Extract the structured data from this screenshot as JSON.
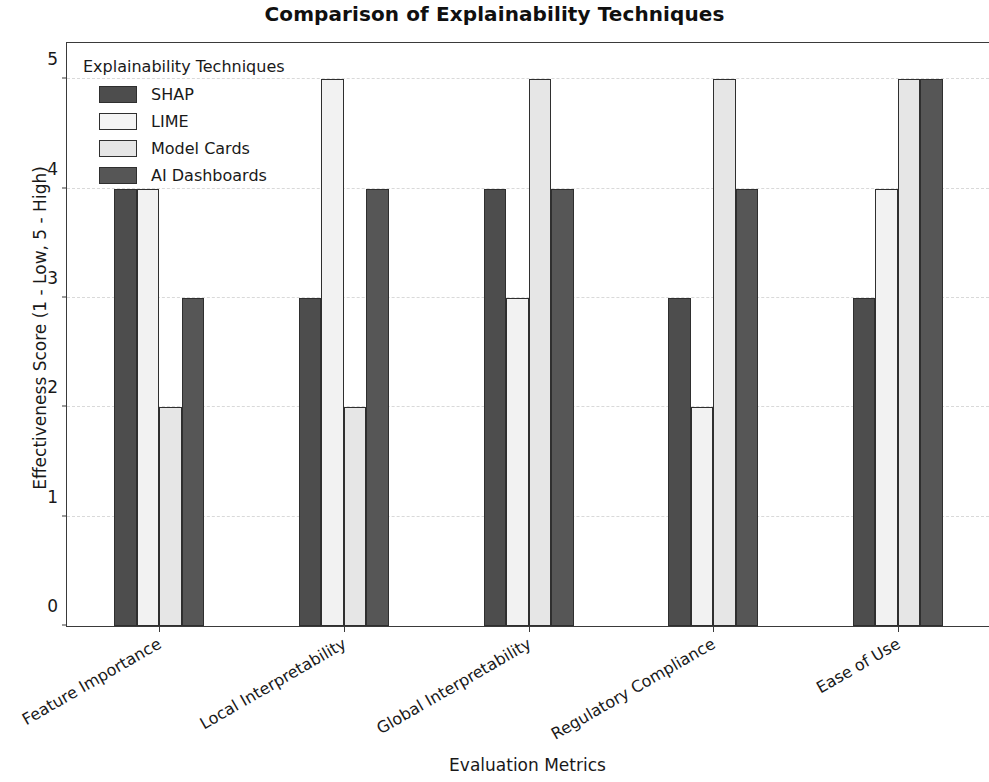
{
  "chart_data": {
    "type": "bar",
    "title": "Comparison of Explainability Techniques",
    "xlabel": "Evaluation Metrics",
    "ylabel": "Effectiveness Score (1 - Low, 5 - High)",
    "categories": [
      "Feature Importance",
      "Local Interpretability",
      "Global Interpretability",
      "Regulatory Compliance",
      "Ease of Use"
    ],
    "series": [
      {
        "name": "SHAP",
        "color": "#4d4d4d",
        "values": [
          4,
          3,
          4,
          3,
          3
        ]
      },
      {
        "name": "LIME",
        "color": "#f2f2f2",
        "values": [
          4,
          5,
          3,
          2,
          4
        ]
      },
      {
        "name": "Model Cards",
        "color": "#e6e6e6",
        "values": [
          2,
          2,
          5,
          5,
          5
        ]
      },
      {
        "name": "AI Dashboards",
        "color": "#565656",
        "values": [
          3,
          4,
          4,
          4,
          5
        ]
      }
    ],
    "ylim": [
      0,
      5.35
    ],
    "yticks": [
      0,
      1,
      2,
      3,
      4,
      5
    ],
    "ytick_labels": [
      "0",
      "1",
      "2",
      "3",
      "4",
      "5"
    ],
    "grid": true,
    "grid_axis": "y",
    "legend_title": "Explainability Techniques",
    "legend_position": "upper left",
    "xtick_rotation": -30
  }
}
